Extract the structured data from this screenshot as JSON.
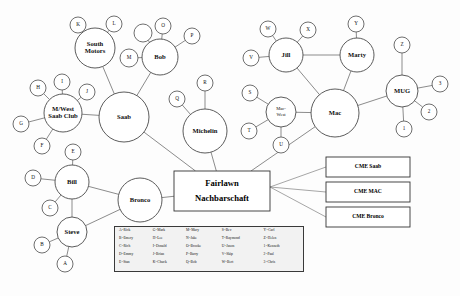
{
  "diagram": {
    "center_box": {
      "line1": "Fairlawn",
      "line2": "Nachbarschaft"
    },
    "hubs": [
      {
        "id": "south_motors",
        "label": "South Motors",
        "two_line": true,
        "l1": "South",
        "l2": "Motors",
        "x": 95,
        "y": 48,
        "r": 20
      },
      {
        "id": "bob",
        "label": "Bob",
        "x": 160,
        "y": 57,
        "r": 18
      },
      {
        "id": "saab",
        "label": "Saab",
        "x": 124,
        "y": 117,
        "r": 25
      },
      {
        "id": "mwest_saab_club",
        "label": "M/West Saab Club",
        "two_line": true,
        "l1": "M/West",
        "l2": "Saab Club",
        "x": 63,
        "y": 113,
        "r": 19
      },
      {
        "id": "bill",
        "label": "Bill",
        "x": 72,
        "y": 182,
        "r": 17
      },
      {
        "id": "bronco",
        "label": "Bronco",
        "x": 140,
        "y": 200,
        "r": 22
      },
      {
        "id": "steve",
        "label": "Steve",
        "x": 72,
        "y": 232,
        "r": 15
      },
      {
        "id": "michelin",
        "label": "Michelin",
        "x": 205,
        "y": 131,
        "r": 22
      },
      {
        "id": "mac",
        "label": "Mac",
        "x": 335,
        "y": 113,
        "r": 24
      },
      {
        "id": "jill",
        "label": "Jill",
        "x": 286,
        "y": 55,
        "r": 17
      },
      {
        "id": "marty",
        "label": "Marty",
        "x": 357,
        "y": 55,
        "r": 17
      },
      {
        "id": "mug",
        "label": "MUG",
        "x": 402,
        "y": 91,
        "r": 16
      },
      {
        "id": "mac_west",
        "label": "Mac-West",
        "two_line": true,
        "l1": "Mac-",
        "l2": "West",
        "x": 281,
        "y": 112,
        "r": 15
      }
    ],
    "leaves": [
      {
        "id": "K",
        "label": "K",
        "x": 78,
        "y": 25,
        "r": 8
      },
      {
        "id": "L",
        "label": "L",
        "x": 114,
        "y": 24,
        "r": 8
      },
      {
        "id": "N",
        "label": "",
        "x": 143,
        "y": 33,
        "r": 9
      },
      {
        "id": "O",
        "label": "O",
        "x": 163,
        "y": 26,
        "r": 8
      },
      {
        "id": "P",
        "label": "P",
        "x": 192,
        "y": 36,
        "r": 8
      },
      {
        "id": "M",
        "label": "M",
        "x": 129,
        "y": 58,
        "r": 9
      },
      {
        "id": "R",
        "label": "R",
        "x": 205,
        "y": 83,
        "r": 8
      },
      {
        "id": "Q",
        "label": "Q",
        "x": 177,
        "y": 99,
        "r": 8
      },
      {
        "id": "H",
        "label": "H",
        "x": 38,
        "y": 88,
        "r": 8
      },
      {
        "id": "I",
        "label": "I",
        "x": 62,
        "y": 82,
        "r": 8
      },
      {
        "id": "J",
        "label": "J",
        "x": 87,
        "y": 92,
        "r": 8
      },
      {
        "id": "G",
        "label": "G",
        "x": 21,
        "y": 124,
        "r": 8
      },
      {
        "id": "F",
        "label": "F",
        "x": 42,
        "y": 146,
        "r": 8
      },
      {
        "id": "E",
        "label": "E",
        "x": 73,
        "y": 152,
        "r": 8
      },
      {
        "id": "D",
        "label": "D",
        "x": 33,
        "y": 178,
        "r": 8
      },
      {
        "id": "C",
        "label": "C",
        "x": 50,
        "y": 208,
        "r": 8
      },
      {
        "id": "B",
        "label": "B",
        "x": 42,
        "y": 245,
        "r": 8
      },
      {
        "id": "A",
        "label": "A",
        "x": 65,
        "y": 264,
        "r": 8
      },
      {
        "id": "W",
        "label": "W",
        "x": 268,
        "y": 29,
        "r": 8
      },
      {
        "id": "X",
        "label": "X",
        "x": 308,
        "y": 30,
        "r": 8
      },
      {
        "id": "V",
        "label": "V",
        "x": 251,
        "y": 58,
        "r": 8
      },
      {
        "id": "Y",
        "label": "Y",
        "x": 356,
        "y": 24,
        "r": 8
      },
      {
        "id": "Z",
        "label": "Z",
        "x": 402,
        "y": 45,
        "r": 8
      },
      {
        "id": "S",
        "label": "S",
        "x": 250,
        "y": 93,
        "r": 8
      },
      {
        "id": "T",
        "label": "T",
        "x": 249,
        "y": 131,
        "r": 8
      },
      {
        "id": "U",
        "label": "U",
        "x": 281,
        "y": 145,
        "r": 8
      },
      {
        "id": "3",
        "label": "3",
        "x": 440,
        "y": 84,
        "r": 8
      },
      {
        "id": "2",
        "label": "2",
        "x": 429,
        "y": 112,
        "r": 8
      },
      {
        "id": "1",
        "label": "1",
        "x": 404,
        "y": 129,
        "r": 8
      }
    ],
    "edges": [
      [
        "south_motors",
        "K"
      ],
      [
        "south_motors",
        "L"
      ],
      [
        "south_motors",
        "saab"
      ],
      [
        "bob",
        "N"
      ],
      [
        "bob",
        "O"
      ],
      [
        "bob",
        "P"
      ],
      [
        "bob",
        "M"
      ],
      [
        "bob",
        "saab"
      ],
      [
        "michelin",
        "R"
      ],
      [
        "michelin",
        "Q"
      ],
      [
        "mwest_saab_club",
        "H"
      ],
      [
        "mwest_saab_club",
        "I"
      ],
      [
        "mwest_saab_club",
        "J"
      ],
      [
        "mwest_saab_club",
        "G"
      ],
      [
        "mwest_saab_club",
        "F"
      ],
      [
        "mwest_saab_club",
        "saab"
      ],
      [
        "bill",
        "E"
      ],
      [
        "bill",
        "D"
      ],
      [
        "bill",
        "C"
      ],
      [
        "bill",
        "bronco"
      ],
      [
        "bill",
        "steve"
      ],
      [
        "steve",
        "B"
      ],
      [
        "steve",
        "A"
      ],
      [
        "steve",
        "bronco"
      ],
      [
        "jill",
        "W"
      ],
      [
        "jill",
        "X"
      ],
      [
        "jill",
        "V"
      ],
      [
        "jill",
        "marty"
      ],
      [
        "jill",
        "mac"
      ],
      [
        "marty",
        "Y"
      ],
      [
        "marty",
        "mac"
      ],
      [
        "mug",
        "Z"
      ],
      [
        "mug",
        "3"
      ],
      [
        "mug",
        "2"
      ],
      [
        "mug",
        "1"
      ],
      [
        "mug",
        "mac"
      ],
      [
        "mac_west",
        "S"
      ],
      [
        "mac_west",
        "T"
      ],
      [
        "mac_west",
        "U"
      ],
      [
        "mac_west",
        "mac"
      ]
    ],
    "center_edges": [
      "saab",
      "michelin",
      "bronco",
      "mac"
    ],
    "cme_boxes": [
      {
        "id": "cme_saab",
        "label": "CME Saab",
        "x": 368,
        "y": 167,
        "w": 84,
        "h": 20
      },
      {
        "id": "cme_mac",
        "label": "CME MAC",
        "x": 368,
        "y": 192,
        "w": 84,
        "h": 20
      },
      {
        "id": "cme_bronco",
        "label": "CME Bronco",
        "x": 368,
        "y": 217,
        "w": 84,
        "h": 20
      }
    ]
  },
  "legend": {
    "columns": [
      [
        "A=Rick",
        "B=Emery",
        "C=Rich",
        "D=Emmy",
        "E=Stan"
      ],
      [
        "G=Mark",
        "H=Lee",
        "I=Donald",
        "J=Brian",
        "K=Chuck"
      ],
      [
        "M=Mary",
        "N=Jake",
        "O=Brooke",
        "P=Barry",
        "Q=Bob"
      ],
      [
        "S=Bev",
        "T=Raymond",
        "U=Jason",
        "V=Skip",
        "W=Bert"
      ],
      [
        "Y=Carl",
        "Z=Helen",
        "1=Kenneth",
        "2=Paul",
        "3=Chris"
      ]
    ]
  },
  "style": {
    "edge_color": "#5a5a5a",
    "node_stroke": "#4a4a4a",
    "node_fill": "#ffffff",
    "legend_bg": "#f2f2f2",
    "background": "#ffffff"
  }
}
